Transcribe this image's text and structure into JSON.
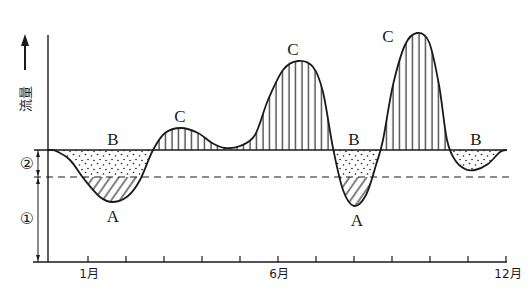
{
  "diagram": {
    "y_axis_label": "流量",
    "curve_labels": {
      "b1": "B",
      "c1": "C",
      "c2": "C",
      "b2": "B",
      "a1": "A",
      "a2": "A",
      "c3": "C",
      "b3": "B"
    },
    "dimension_labels": {
      "two": "②",
      "one": "①"
    },
    "x_axis_labels": {
      "m1": "1月",
      "m6": "6月",
      "m12": "12月"
    },
    "x_axis_tick_count": 12,
    "region_fills": {
      "C": "vertical-hatch",
      "B": "dotted",
      "A": "diagonal-hatch"
    },
    "ink_color": "#1a1a1a"
  }
}
